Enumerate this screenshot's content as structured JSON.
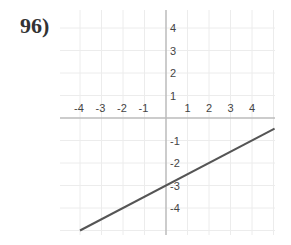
{
  "problem": {
    "number": "96)"
  },
  "chart_data": {
    "type": "line",
    "title": "",
    "xlabel": "",
    "ylabel": "",
    "xlim": [
      -4.5,
      4.5
    ],
    "ylim": [
      -4.5,
      4.5
    ],
    "grid": true,
    "x_ticks": [
      -4,
      -3,
      -2,
      -1,
      1,
      2,
      3,
      4
    ],
    "y_ticks": [
      4,
      3,
      2,
      1,
      -1,
      -2,
      -3,
      -4
    ],
    "series": [
      {
        "name": "line",
        "equation": "y = 0.5x - 3",
        "slope": 0.5,
        "intercept": -3,
        "x": [
          -4,
          4.5
        ],
        "y": [
          -5,
          -0.75
        ],
        "color": "#555555"
      }
    ]
  }
}
